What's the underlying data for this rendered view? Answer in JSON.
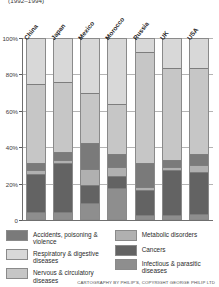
{
  "title": "(1992–1994)",
  "credit": "CARTOGRAPHY BY PHILIP'S, COPYRIGHT GEORGE PHILIP LTD",
  "axis": {
    "ticks": [
      "100%",
      "80%",
      "60%",
      "40%",
      "20%",
      "0"
    ]
  },
  "legend": {
    "left": [
      {
        "label": "Accidents, poisoning & violence",
        "color": "#7a7a7a",
        "key": "accidents"
      },
      {
        "label": "Respiratory & digestive diseases",
        "color": "#d8d8d8",
        "key": "respiratory"
      },
      {
        "label": "Nervous & circulatory diseases",
        "color": "#c6c6c6",
        "key": "nervous"
      }
    ],
    "right": [
      {
        "label": "Metabolic disorders",
        "color": "#b0b0b0",
        "key": "metabolic"
      },
      {
        "label": "Cancers",
        "color": "#636363",
        "key": "cancers"
      },
      {
        "label": "Infectious & parasitic diseases",
        "color": "#8e8e8e",
        "key": "infectious"
      }
    ]
  },
  "chart_data": {
    "type": "bar",
    "subtype": "stacked-percentage",
    "title": "(1992–1994)",
    "xlabel": "",
    "ylabel": "",
    "ylim": [
      0,
      100
    ],
    "ytick_labels": [
      "0",
      "20%",
      "40%",
      "60%",
      "80%",
      "100%"
    ],
    "ytick_values": [
      0,
      20,
      40,
      60,
      80,
      100
    ],
    "grid": true,
    "legend_position": "bottom",
    "stack_order_bottom_to_top": [
      "infectious",
      "cancers",
      "metabolic",
      "accidents",
      "nervous",
      "respiratory"
    ],
    "categories": [
      "China",
      "Japan",
      "Mexico",
      "Morocco",
      "Russia",
      "UK",
      "USA"
    ],
    "series": [
      {
        "name": "Infectious & parasitic diseases",
        "color": "#8e8e8e",
        "values": [
          4,
          4,
          9,
          17,
          2,
          2,
          3
        ]
      },
      {
        "name": "Cancers",
        "color": "#636363",
        "values": [
          21,
          27,
          10,
          7,
          14,
          25,
          23
        ]
      },
      {
        "name": "Metabolic disorders",
        "color": "#b0b0b0",
        "values": [
          2,
          2,
          9,
          5,
          2,
          2,
          4
        ]
      },
      {
        "name": "Accidents, poisoning & violence",
        "color": "#7a7a7a",
        "values": [
          4,
          4,
          14,
          7,
          13,
          4,
          6
        ]
      },
      {
        "name": "Nervous & circulatory diseases",
        "color": "#c6c6c6",
        "values": [
          44,
          39,
          28,
          28,
          62,
          51,
          48
        ]
      },
      {
        "name": "Respiratory & digestive diseases",
        "color": "#d8d8d8",
        "values": [
          25,
          24,
          30,
          36,
          7,
          16,
          16
        ]
      }
    ]
  }
}
